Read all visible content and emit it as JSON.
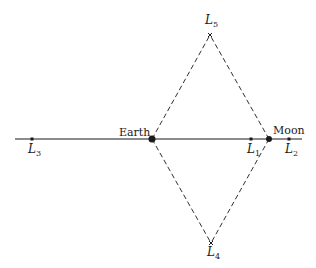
{
  "diagram": {
    "bodies": [
      {
        "id": "earth",
        "label": "Earth",
        "x": 152,
        "y": 139
      },
      {
        "id": "moon",
        "label": "Moon",
        "x": 269,
        "y": 139
      }
    ],
    "points": [
      {
        "id": "L1",
        "letter": "L",
        "sub": "1",
        "x": 251,
        "y": 139
      },
      {
        "id": "L2",
        "letter": "L",
        "sub": "2",
        "x": 289,
        "y": 139
      },
      {
        "id": "L3",
        "letter": "L",
        "sub": "3",
        "x": 32,
        "y": 139
      },
      {
        "id": "L4",
        "letter": "L",
        "sub": "4",
        "x": 211,
        "y": 243
      },
      {
        "id": "L5",
        "letter": "L",
        "sub": "5",
        "x": 210,
        "y": 35
      }
    ],
    "axis_line": {
      "x1": 15,
      "x2": 302,
      "y": 139
    },
    "colors": {
      "ink": "#1a1a1a",
      "background": "#ffffff"
    }
  }
}
